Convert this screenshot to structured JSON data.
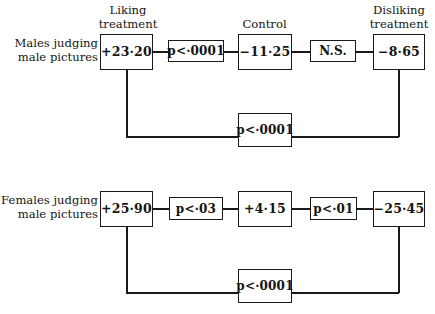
{
  "figure": {
    "type": "flow-diagram",
    "background_color": "#ffffff",
    "line_color": "#1a1a1a",
    "panels": [
      {
        "id": "males-judging-male-pictures",
        "side_label_line1": "Males judging",
        "side_label_line2": "male pictures",
        "top_labels": [
          {
            "for": "node1",
            "line1": "Liking",
            "line2": "treatment"
          },
          {
            "for": "node2",
            "line1": "Control",
            "line2": ""
          },
          {
            "for": "node3",
            "line1": "Disliking",
            "line2": "treatment"
          }
        ],
        "nodes": [
          {
            "id": "node1",
            "value": "+23·20"
          },
          {
            "id": "node2",
            "value": "−11·25"
          },
          {
            "id": "node3",
            "value": "−8·65"
          }
        ],
        "links": [
          {
            "id": "link1",
            "from": "node1",
            "to": "node2",
            "label": "p<·0001"
          },
          {
            "id": "link2",
            "from": "node2",
            "to": "node3",
            "label": "N.S."
          },
          {
            "id": "link3",
            "from": "node1",
            "to": "node3",
            "label": "p<·0001",
            "route": "bottom"
          }
        ]
      },
      {
        "id": "females-judging-male-pictures",
        "side_label_line1": "Females judging",
        "side_label_line2": "male pictures",
        "top_labels": [],
        "nodes": [
          {
            "id": "node4",
            "value": "+25·90"
          },
          {
            "id": "node5",
            "value": "+4·15"
          },
          {
            "id": "node6",
            "value": "−25·45"
          }
        ],
        "links": [
          {
            "id": "link4",
            "from": "node4",
            "to": "node5",
            "label": "p<·03"
          },
          {
            "id": "link5",
            "from": "node5",
            "to": "node6",
            "label": "p<·01"
          },
          {
            "id": "link6",
            "from": "node4",
            "to": "node6",
            "label": "p<·0001",
            "route": "bottom"
          }
        ]
      }
    ]
  }
}
